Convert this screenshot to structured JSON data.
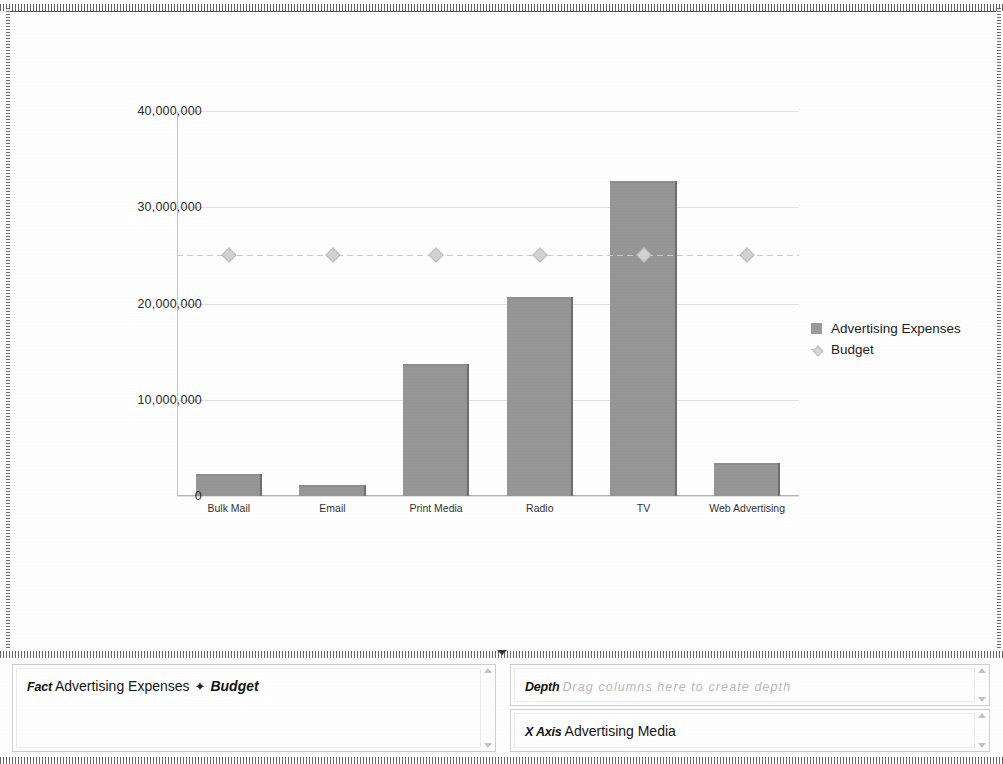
{
  "chart_data": {
    "type": "bar",
    "title": "",
    "xlabel": "",
    "ylabel": "",
    "categories": [
      "Bulk Mail",
      "Email",
      "Print Media",
      "Radio",
      "TV",
      "Web Advertising"
    ],
    "ylim": [
      0,
      40000000
    ],
    "yticks": [
      0,
      10000000,
      20000000,
      30000000,
      40000000
    ],
    "ytick_labels": [
      "0",
      "10,000,000",
      "20,000,000",
      "30,000,000",
      "40,000,000"
    ],
    "grid": true,
    "legend_position": "right",
    "series": [
      {
        "name": "Advertising Expenses",
        "type": "bar",
        "color": "#969696",
        "values": [
          2300000,
          1100000,
          13700000,
          20700000,
          32700000,
          3400000
        ]
      },
      {
        "name": "Budget",
        "type": "line",
        "color": "#c9c9c9",
        "marker": "diamond",
        "values": [
          25000000,
          25000000,
          25000000,
          25000000,
          25000000,
          25000000
        ]
      }
    ]
  },
  "legend": {
    "items": [
      {
        "label": "Advertising Expenses",
        "marker": "square-swatch-icon"
      },
      {
        "label": "Budget",
        "marker": "line-diamond-icon"
      }
    ]
  },
  "panels": {
    "splitter_icon": "collapse-triangle-icon",
    "fact": {
      "label": "Fact",
      "values": [
        "Advertising Expenses",
        "Budget"
      ],
      "separator": "✦",
      "scroll_up_icon": "scroll-up-arrow-icon",
      "scroll_down_icon": "scroll-down-arrow-icon"
    },
    "depth": {
      "label": "Depth",
      "value": "",
      "placeholder": "Drag columns here to create depth",
      "scroll_up_icon": "scroll-up-arrow-icon",
      "scroll_down_icon": "scroll-down-arrow-icon"
    },
    "xaxis": {
      "label": "X Axis",
      "value": "Advertising Media",
      "scroll_up_icon": "scroll-up-arrow-icon",
      "scroll_down_icon": "scroll-down-arrow-icon"
    }
  }
}
